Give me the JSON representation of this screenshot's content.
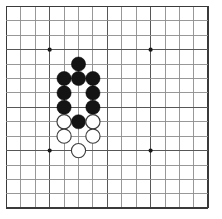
{
  "board": {
    "title": "Go Board",
    "background_color": "#ffffff",
    "line_color": "#8d8d8d",
    "line_color_strong": "#575757",
    "edge_color": "#3a3a3a",
    "black_stone_color": "#141414",
    "white_stone_color": "#ffffff",
    "white_stone_border": "#3d3d3d",
    "star_point_color": "#1a1a1a",
    "columns": 15,
    "rows": 15,
    "origin_x": 6.4,
    "origin_y": 6.4,
    "spacing": 14.42,
    "stone_radius": 7.1,
    "star_radius": 2.1,
    "star_points": [
      {
        "col": 3,
        "row": 3
      },
      {
        "col": 10,
        "row": 3
      },
      {
        "col": 3,
        "row": 10
      },
      {
        "col": 10,
        "row": 10
      }
    ],
    "strong_lines": {
      "cols": [
        3,
        7,
        10,
        14
      ],
      "rows": [
        3,
        7,
        10,
        14
      ]
    }
  },
  "stones": [
    {
      "color": "black",
      "col": 5,
      "row": 4,
      "label": "black-stone-e5"
    },
    {
      "color": "black",
      "col": 4,
      "row": 5,
      "label": "black-stone-d6"
    },
    {
      "color": "black",
      "col": 5,
      "row": 5,
      "label": "black-stone-e6"
    },
    {
      "color": "black",
      "col": 6,
      "row": 5,
      "label": "black-stone-f6"
    },
    {
      "color": "black",
      "col": 4,
      "row": 6,
      "label": "black-stone-d7"
    },
    {
      "color": "black",
      "col": 6,
      "row": 6,
      "label": "black-stone-f7"
    },
    {
      "color": "black",
      "col": 4,
      "row": 7,
      "label": "black-stone-d8"
    },
    {
      "color": "black",
      "col": 6,
      "row": 7,
      "label": "black-stone-f8"
    },
    {
      "color": "white",
      "col": 4,
      "row": 8,
      "label": "white-stone-d9"
    },
    {
      "color": "black",
      "col": 5,
      "row": 8,
      "label": "black-stone-e9"
    },
    {
      "color": "white",
      "col": 6,
      "row": 8,
      "label": "white-stone-f9"
    },
    {
      "color": "white",
      "col": 4,
      "row": 9,
      "label": "white-stone-d10"
    },
    {
      "color": "white",
      "col": 6,
      "row": 9,
      "label": "white-stone-f10"
    },
    {
      "color": "white",
      "col": 5,
      "row": 10,
      "label": "white-stone-e11"
    }
  ]
}
